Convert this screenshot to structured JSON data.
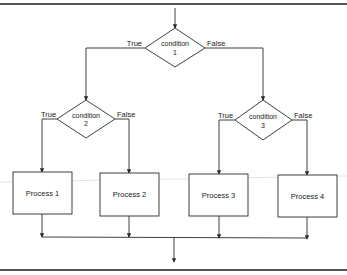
{
  "diagram": {
    "type": "flowchart",
    "colors": {
      "background": "#ffffff",
      "stroke": "#2a2a2a",
      "frame": "#1e1e1e",
      "paper_streak": "#e4e4e4"
    },
    "decisions": [
      {
        "id": "condition-1",
        "line1": "condition",
        "line2": "1",
        "true_label": "True",
        "false_label": "False"
      },
      {
        "id": "condition-2",
        "line1": "condition",
        "line2": "2",
        "true_label": "True",
        "false_label": "False"
      },
      {
        "id": "condition-3",
        "line1": "condition",
        "line2": "3",
        "true_label": "True",
        "false_label": "False"
      }
    ],
    "processes": [
      {
        "id": "process-1",
        "label": "Process 1"
      },
      {
        "id": "process-2",
        "label": "Process 2"
      },
      {
        "id": "process-3",
        "label": "Process 3"
      },
      {
        "id": "process-4",
        "label": "Process 4"
      }
    ],
    "edges": [
      {
        "from": "entry",
        "to": "condition-1"
      },
      {
        "from": "condition-1",
        "to": "condition-2",
        "label": "True"
      },
      {
        "from": "condition-1",
        "to": "condition-3",
        "label": "False"
      },
      {
        "from": "condition-2",
        "to": "process-1",
        "label": "True"
      },
      {
        "from": "condition-2",
        "to": "process-2",
        "label": "False"
      },
      {
        "from": "condition-3",
        "to": "process-3",
        "label": "True"
      },
      {
        "from": "condition-3",
        "to": "process-4",
        "label": "False"
      },
      {
        "from": "process-1",
        "to": "exit"
      },
      {
        "from": "process-2",
        "to": "exit"
      },
      {
        "from": "process-3",
        "to": "exit"
      },
      {
        "from": "process-4",
        "to": "exit"
      }
    ]
  }
}
